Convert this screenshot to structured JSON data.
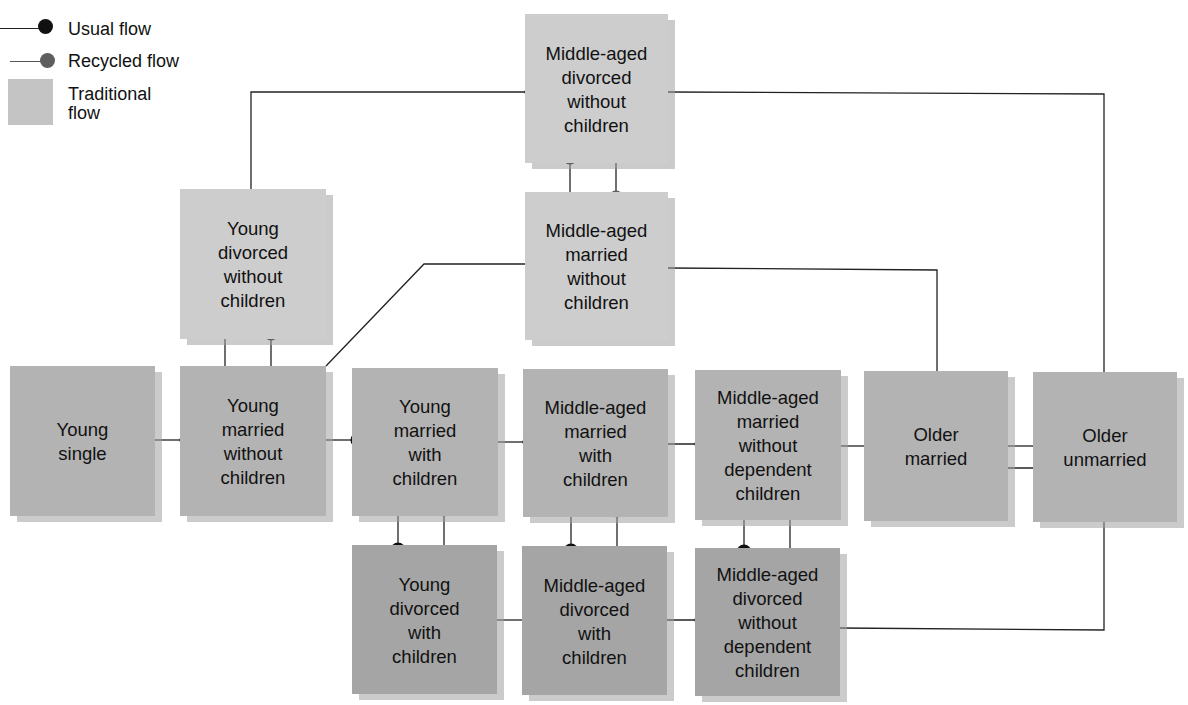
{
  "legend": {
    "usual_flow": "Usual flow",
    "recycled_flow": "Recycled flow",
    "traditional_flow": "Traditional\nflow"
  },
  "colors": {
    "usual_dot": "#111111",
    "recycled_dot": "#5e5e5e",
    "traditional_box": "#b3b3b3",
    "nontraditional_light_box": "#cdcdcd",
    "nontraditional_dark_box": "#a5a5a5",
    "line": "#222222"
  },
  "nodes": {
    "young_single": "Young\nsingle",
    "young_married_without_children": "Young\nmarried\nwithout\nchildren",
    "young_married_with_children": "Young\nmarried\nwith\nchildren",
    "middle_aged_married_with_children": "Middle-aged\nmarried\nwith\nchildren",
    "middle_aged_married_without_dependent_children": "Middle-aged\nmarried\nwithout\ndependent\nchildren",
    "older_married": "Older\nmarried",
    "older_unmarried": "Older\nunmarried",
    "young_divorced_without_children": "Young\ndivorced\nwithout\nchildren",
    "middle_aged_divorced_without_children": "Middle-aged\ndivorced\nwithout\nchildren",
    "middle_aged_married_without_children": "Middle-aged\nmarried\nwithout\nchildren",
    "young_divorced_with_children": "Young\ndivorced\nwith\nchildren",
    "middle_aged_divorced_with_children": "Middle-aged\ndivorced\nwith\nchildren",
    "middle_aged_divorced_without_dependent_children": "Middle-aged\ndivorced\nwithout\ndependent\nchildren"
  },
  "edges": [
    {
      "from": "Young single",
      "to": "Young married without children",
      "type": "usual"
    },
    {
      "from": "Young married without children",
      "to": "Young married with children",
      "type": "usual"
    },
    {
      "from": "Young married with children",
      "to": "Middle-aged married with children",
      "type": "usual"
    },
    {
      "from": "Middle-aged married with children",
      "to": "Middle-aged married without dependent children",
      "type": "usual"
    },
    {
      "from": "Middle-aged married without dependent children",
      "to": "Older married",
      "type": "usual"
    },
    {
      "from": "Older married",
      "to": "Older unmarried",
      "type": "usual"
    },
    {
      "from": "Older unmarried",
      "to": "Older married",
      "type": "usual"
    },
    {
      "from": "Young married without children",
      "to": "Young divorced without children",
      "type": "usual"
    },
    {
      "from": "Young divorced without children",
      "to": "Young married without children",
      "type": "recycled"
    },
    {
      "from": "Young divorced without children",
      "to": "Middle-aged divorced without children",
      "type": "usual"
    },
    {
      "from": "Young married without children",
      "to": "Middle-aged married without children",
      "type": "usual"
    },
    {
      "from": "Middle-aged married without children",
      "to": "Middle-aged divorced without children",
      "type": "usual"
    },
    {
      "from": "Middle-aged divorced without children",
      "to": "Middle-aged married without children",
      "type": "recycled"
    },
    {
      "from": "Middle-aged divorced without children",
      "to": "Older unmarried",
      "type": "usual"
    },
    {
      "from": "Middle-aged married without children",
      "to": "Older married",
      "type": "usual"
    },
    {
      "from": "Young married with children",
      "to": "Young divorced with children",
      "type": "usual"
    },
    {
      "from": "Young divorced with children",
      "to": "Young married with children",
      "type": "recycled"
    },
    {
      "from": "Middle-aged married with children",
      "to": "Middle-aged divorced with children",
      "type": "usual"
    },
    {
      "from": "Middle-aged divorced with children",
      "to": "Middle-aged married with children",
      "type": "recycled"
    },
    {
      "from": "Middle-aged married without dependent children",
      "to": "Middle-aged divorced without dependent children",
      "type": "usual"
    },
    {
      "from": "Middle-aged divorced without dependent children",
      "to": "Middle-aged married without dependent children",
      "type": "recycled"
    },
    {
      "from": "Young divorced with children",
      "to": "Middle-aged divorced with children",
      "type": "usual"
    },
    {
      "from": "Middle-aged divorced with children",
      "to": "Middle-aged divorced without dependent children",
      "type": "usual"
    },
    {
      "from": "Middle-aged divorced without dependent children",
      "to": "Older unmarried",
      "type": "usual"
    }
  ]
}
